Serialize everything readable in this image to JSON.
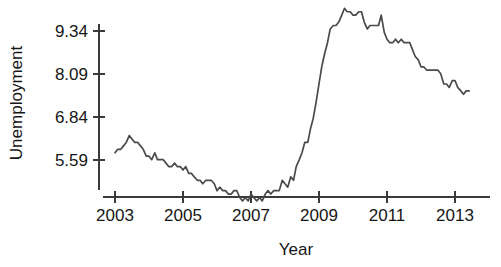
{
  "chart_data": {
    "type": "line",
    "title": "",
    "subtitle": "",
    "xlabel": "Year",
    "ylabel": "Unemployment",
    "grid": false,
    "legend": false,
    "legend_position": "none",
    "line_color": "#4a4a4a",
    "axis_color": "#3b3b3b",
    "background_color": "#ffffff",
    "xlim": [
      2002.9,
      2013.6
    ],
    "ylim": [
      4.1,
      10.3
    ],
    "xticks": [
      2003,
      2005,
      2007,
      2009,
      2011,
      2013
    ],
    "xtick_labels": [
      "2003",
      "2005",
      "2007",
      "2009",
      "2011",
      "2013"
    ],
    "yticks": [
      5.59,
      6.84,
      8.09,
      9.34
    ],
    "ytick_labels": [
      "5.59",
      "6.84",
      "8.09",
      "9.34"
    ],
    "series": [
      {
        "name": "Unemployment rate",
        "x": [
          2003.0,
          2003.08,
          2003.17,
          2003.25,
          2003.33,
          2003.42,
          2003.5,
          2003.58,
          2003.67,
          2003.75,
          2003.83,
          2003.92,
          2004.0,
          2004.08,
          2004.17,
          2004.25,
          2004.33,
          2004.42,
          2004.5,
          2004.58,
          2004.67,
          2004.75,
          2004.83,
          2004.92,
          2005.0,
          2005.08,
          2005.17,
          2005.25,
          2005.33,
          2005.42,
          2005.5,
          2005.58,
          2005.67,
          2005.75,
          2005.83,
          2005.92,
          2006.0,
          2006.08,
          2006.17,
          2006.25,
          2006.33,
          2006.42,
          2006.5,
          2006.58,
          2006.67,
          2006.75,
          2006.83,
          2006.92,
          2007.0,
          2007.08,
          2007.17,
          2007.25,
          2007.33,
          2007.42,
          2007.5,
          2007.58,
          2007.67,
          2007.75,
          2007.83,
          2007.92,
          2008.0,
          2008.08,
          2008.17,
          2008.25,
          2008.33,
          2008.42,
          2008.5,
          2008.58,
          2008.67,
          2008.75,
          2008.83,
          2008.92,
          2009.0,
          2009.08,
          2009.17,
          2009.25,
          2009.33,
          2009.42,
          2009.5,
          2009.58,
          2009.67,
          2009.75,
          2009.83,
          2009.92,
          2010.0,
          2010.08,
          2010.17,
          2010.25,
          2010.33,
          2010.42,
          2010.5,
          2010.58,
          2010.67,
          2010.75,
          2010.83,
          2010.92,
          2011.0,
          2011.08,
          2011.17,
          2011.25,
          2011.33,
          2011.42,
          2011.5,
          2011.58,
          2011.67,
          2011.75,
          2011.83,
          2011.92,
          2012.0,
          2012.08,
          2012.17,
          2012.25,
          2012.33,
          2012.42,
          2012.5,
          2012.58,
          2012.67,
          2012.75,
          2012.83,
          2012.92,
          2013.0,
          2013.08,
          2013.17,
          2013.25,
          2013.33,
          2013.42
        ],
        "values": [
          5.8,
          5.9,
          5.9,
          6.0,
          6.1,
          6.3,
          6.2,
          6.1,
          6.1,
          6.0,
          5.9,
          5.7,
          5.7,
          5.6,
          5.8,
          5.6,
          5.6,
          5.6,
          5.5,
          5.4,
          5.4,
          5.5,
          5.4,
          5.4,
          5.3,
          5.4,
          5.2,
          5.2,
          5.1,
          5.0,
          5.0,
          4.9,
          5.0,
          5.0,
          5.0,
          4.9,
          4.7,
          4.8,
          4.7,
          4.7,
          4.6,
          4.6,
          4.7,
          4.7,
          4.5,
          4.4,
          4.5,
          4.4,
          4.6,
          4.5,
          4.4,
          4.5,
          4.4,
          4.6,
          4.7,
          4.6,
          4.7,
          4.7,
          4.7,
          5.0,
          4.9,
          4.8,
          5.1,
          5.0,
          5.4,
          5.6,
          5.8,
          6.1,
          6.1,
          6.5,
          6.8,
          7.3,
          7.8,
          8.3,
          8.7,
          9.0,
          9.4,
          9.5,
          9.5,
          9.6,
          9.8,
          10.0,
          9.9,
          9.9,
          9.8,
          9.8,
          9.9,
          9.9,
          9.6,
          9.4,
          9.5,
          9.5,
          9.5,
          9.5,
          9.8,
          9.3,
          9.1,
          9.0,
          9.0,
          9.1,
          9.0,
          9.1,
          9.0,
          9.0,
          9.0,
          8.8,
          8.6,
          8.5,
          8.3,
          8.3,
          8.2,
          8.2,
          8.2,
          8.2,
          8.2,
          8.1,
          7.8,
          7.8,
          7.7,
          7.9,
          7.9,
          7.7,
          7.6,
          7.5,
          7.6,
          7.6
        ]
      }
    ]
  },
  "axes": {
    "y_title": "Unemployment",
    "x_title": "Year"
  }
}
